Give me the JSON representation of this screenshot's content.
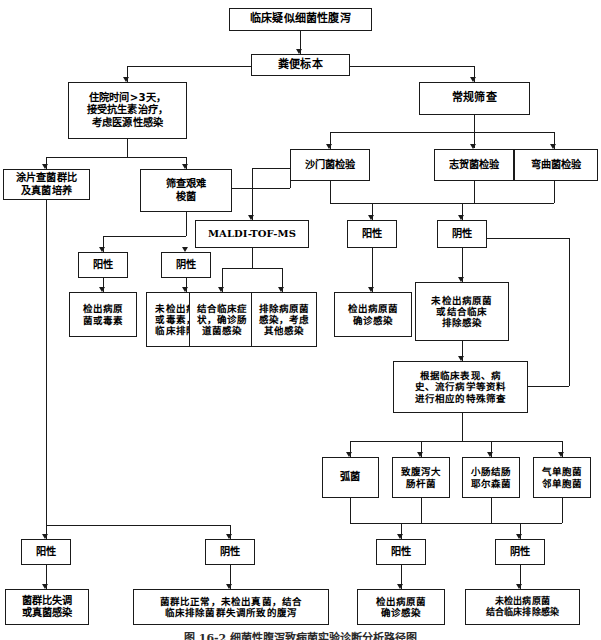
{
  "figure": {
    "caption": "图 16-2  细菌性腹泻致病菌实验诊断分析路径图",
    "line_color": "#1a1a1a",
    "background": "#ffffff"
  },
  "nodes": {
    "root": "临床疑似细菌性腹泻",
    "specimen": "粪便标本",
    "nosocomial": "住院时间>3天，\n接受抗生素治疗，\n考虑医源性感染",
    "routine_screen": "常规筛查",
    "smear_fungal": "涂片查菌群比\n及真菌培养",
    "screen_cdiff": "筛查艰难\n梭菌",
    "test_salmonella": "沙门菌检验",
    "test_shigella": "志贺菌检验",
    "test_campylobacter": "弯曲菌检验",
    "cdiff_positive": "阳性",
    "cdiff_negative": "阴性",
    "maldi": "MALDI-TOF-MS",
    "routine_positive": "阳性",
    "routine_negative": "阴性",
    "cdiff_pos_result": "检出病原\n菌或毒素",
    "cdiff_neg_result": "未检出病原菌\n或毒素，结合\n临床排除感染",
    "maldi_result_pos": "结合临床症\n状，确诊肠\n道菌感染",
    "maldi_result_neg": "排除病原菌\n感染，考虑\n其他感染",
    "routine_pos_result": "检出病原菌\n确诊感染",
    "routine_neg_result": "未检出病原菌\n或结合临床\n排除感染",
    "special_screen": "根据临床表现、病\n史、流行病学等资料\n进行相应的特殊筛查",
    "vibrio": "弧菌",
    "dec": "致腹泻大\n肠杆菌",
    "yersinia": "小肠结肠\n耶尔森菌",
    "aeromonas": "气单胞菌\n邻单胞菌",
    "special_positive": "阳性",
    "special_negative": "阴性",
    "special_pos_result": "检出病原菌\n确诊感染",
    "special_neg_result": "未检出病原菌\n结合临床排除感染",
    "flora_positive": "阳性",
    "flora_negative": "阴性",
    "flora_pos_result": "菌群比失调\n或真菌感染",
    "flora_neg_result": "菌群比正常，未检出真菌，结合\n临床排除菌群失调所致的腹泻"
  }
}
